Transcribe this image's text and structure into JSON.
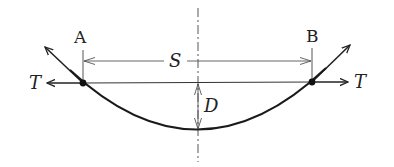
{
  "diagram": {
    "type": "cable-sag",
    "labels": {
      "point_a": "A",
      "point_b": "B",
      "span": "S",
      "sag": "D",
      "tension_left": "T",
      "tension_right": "T"
    },
    "colors": {
      "line": "#222222",
      "thin_line": "#333333",
      "background": "#ffffff"
    }
  }
}
